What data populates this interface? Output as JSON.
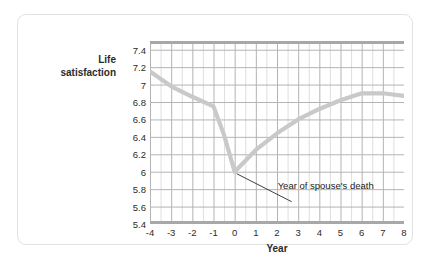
{
  "chart_data": {
    "type": "line",
    "title": "",
    "xlabel": "Year",
    "ylabel": "Life satisfaction",
    "ylabel_lines": [
      "Life",
      "satisfaction"
    ],
    "xlim": [
      -4,
      8
    ],
    "ylim": [
      5.4,
      7.5
    ],
    "grid": true,
    "legend": "none",
    "x_ticks": [
      "-4",
      "-3",
      "-2",
      "-1",
      "0",
      "1",
      "2",
      "3",
      "4",
      "5",
      "6",
      "7",
      "8"
    ],
    "y_ticks": [
      "7.4",
      "7.2",
      "7",
      "6.8",
      "6.6",
      "6.4",
      "6.2",
      "6",
      "5.8",
      "5.6",
      "5.4"
    ],
    "series": [
      {
        "name": "Life satisfaction",
        "color": "#c9c9c9",
        "x": [
          -4,
          -3,
          -2,
          -1,
          -0.5,
          0,
          1,
          2,
          3,
          4,
          5,
          6,
          7,
          8
        ],
        "values": [
          7.15,
          6.98,
          6.86,
          6.75,
          6.42,
          6.0,
          6.25,
          6.44,
          6.6,
          6.72,
          6.82,
          6.9,
          6.9,
          6.87
        ]
      }
    ],
    "annotations": [
      {
        "text": "Year of spouse's death",
        "points_to_x": 0,
        "points_to_y": 6.0
      }
    ]
  }
}
